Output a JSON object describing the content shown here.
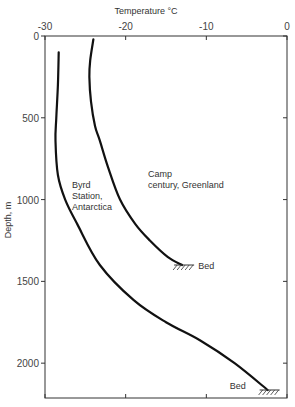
{
  "chart_data": {
    "type": "line",
    "title": "",
    "xlabel": "Temperature °C",
    "ylabel": "Depth, m",
    "xlim": [
      -30,
      0
    ],
    "ylim": [
      0,
      2200
    ],
    "y_inverted": true,
    "x_axis_position": "top",
    "x_ticks": [
      -30,
      -20,
      -10,
      0
    ],
    "x_tick_labels": [
      "-30",
      "-20",
      "-10",
      "0"
    ],
    "y_ticks": [
      0,
      500,
      1000,
      1500,
      2000
    ],
    "y_tick_labels": [
      "0",
      "500",
      "1000",
      "1500",
      "2000"
    ],
    "grid": false,
    "series": [
      {
        "name": "Camp century, Greenland",
        "label_lines": [
          "Camp",
          "century, Greenland"
        ],
        "points": [
          [
            -24.0,
            20
          ],
          [
            -24.4,
            150
          ],
          [
            -24.5,
            250
          ],
          [
            -24.3,
            400
          ],
          [
            -23.8,
            550
          ],
          [
            -23.2,
            640
          ],
          [
            -22.2,
            800
          ],
          [
            -20.7,
            1000
          ],
          [
            -18.8,
            1150
          ],
          [
            -17.0,
            1250
          ],
          [
            -14.8,
            1350
          ],
          [
            -13.0,
            1400
          ]
        ],
        "end_annotation": "Bed"
      },
      {
        "name": "Byrd Station, Antarctica",
        "label_lines": [
          "Byrd",
          "Station,",
          "Antarctica"
        ],
        "points": [
          [
            -28.3,
            100
          ],
          [
            -28.4,
            300
          ],
          [
            -28.6,
            500
          ],
          [
            -28.7,
            640
          ],
          [
            -28.4,
            850
          ],
          [
            -27.5,
            1000
          ],
          [
            -26.0,
            1150
          ],
          [
            -23.2,
            1400
          ],
          [
            -19.0,
            1615
          ],
          [
            -15.0,
            1750
          ],
          [
            -10.8,
            1860
          ],
          [
            -6.5,
            2000
          ],
          [
            -2.4,
            2164
          ]
        ],
        "end_annotation": "Bed"
      }
    ]
  }
}
